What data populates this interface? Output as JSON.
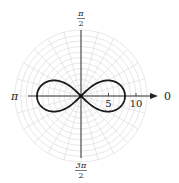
{
  "chart_data": {
    "type": "line",
    "subtype": "polar",
    "title": "",
    "equation": "r^2 = 64 cos(2θ)",
    "curve_name": "lemniscate",
    "a": 8,
    "angle_labels": {
      "right": "0",
      "top_num": "π",
      "top_den": "2",
      "left": "π",
      "bottom_num": "3π",
      "bottom_den": "2"
    },
    "radial_ticks": [
      {
        "value": 5,
        "label": "5"
      },
      {
        "value": 10,
        "label": "10"
      }
    ],
    "grid": {
      "on": true,
      "circle_step": 1,
      "max_radius": 12,
      "radial_line_step_deg": 15
    },
    "rlim": [
      0,
      12
    ],
    "extrema": {
      "max_r": 8,
      "max_r_angles": [
        "0",
        "π"
      ]
    }
  },
  "layout": {
    "center_x": 81,
    "center_y": 96,
    "px_per_unit": 5.5
  }
}
